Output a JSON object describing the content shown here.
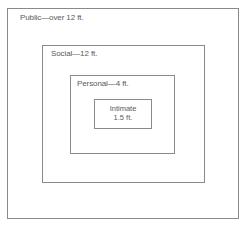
{
  "diagram": {
    "type": "nested-zones",
    "zones": [
      {
        "name": "Public",
        "distance": "over 12 ft.",
        "label": "Public—over 12 ft."
      },
      {
        "name": "Social",
        "distance": "12 ft.",
        "label": "Social—12 ft."
      },
      {
        "name": "Personal",
        "distance": "4 ft.",
        "label": "Personal—4 ft."
      },
      {
        "name": "Intimate",
        "distance": "1.5 ft.",
        "line1": "Intimate",
        "line2": "1.5 ft."
      }
    ]
  }
}
